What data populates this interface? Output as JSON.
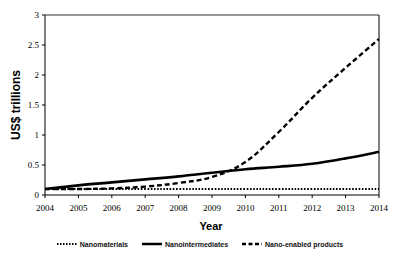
{
  "chart_data": {
    "type": "line",
    "title": "",
    "xlabel": "Year",
    "ylabel": "US$ trillions",
    "x": [
      2004,
      2005,
      2006,
      2007,
      2008,
      2009,
      2010,
      2011,
      2012,
      2013,
      2014
    ],
    "xlim": [
      2004,
      2014
    ],
    "ylim": [
      0,
      3
    ],
    "yticks": [
      0,
      0.5,
      1,
      1.5,
      2,
      2.5,
      3
    ],
    "ytick_labels": [
      "0",
      "0.5",
      "1",
      "1.5",
      "2",
      "2.5",
      "3"
    ],
    "xtick_labels": [
      "2004",
      "2005",
      "2006",
      "2007",
      "2008",
      "2009",
      "2010",
      "2011",
      "2012",
      "2013",
      "2014"
    ],
    "grid": false,
    "legend_position": "bottom",
    "series": [
      {
        "name": "Nanomaterials",
        "style": "dotted",
        "values": [
          0.1,
          0.1,
          0.1,
          0.1,
          0.1,
          0.1,
          0.1,
          0.1,
          0.1,
          0.1,
          0.1
        ]
      },
      {
        "name": "Nanointermediates",
        "style": "solid",
        "values": [
          0.1,
          0.16,
          0.21,
          0.26,
          0.31,
          0.37,
          0.43,
          0.47,
          0.52,
          0.61,
          0.72
        ]
      },
      {
        "name": "Nano-enabled products",
        "style": "dashed",
        "values": [
          0.1,
          0.1,
          0.11,
          0.14,
          0.2,
          0.3,
          0.55,
          1.05,
          1.62,
          2.12,
          2.6
        ]
      }
    ]
  },
  "legend": {
    "items": [
      {
        "label": "Nanomaterials"
      },
      {
        "label": "Nanointermediates"
      },
      {
        "label": "Nano-enabled products"
      }
    ]
  }
}
